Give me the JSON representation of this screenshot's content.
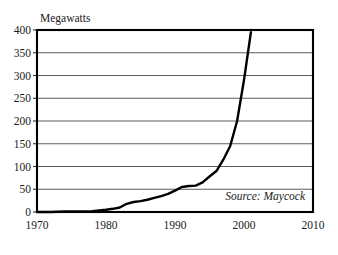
{
  "chart_data": {
    "type": "line",
    "title": "Megawatts",
    "xlabel": "",
    "ylabel": "Megawatts",
    "xlim": [
      1970,
      2010
    ],
    "ylim": [
      0,
      400
    ],
    "ytick_step": 50,
    "xtick_step": 10,
    "grid": "horizontal",
    "legend": "none",
    "annotation": "Source: Maycock",
    "ytick_labels": [
      "0",
      "50",
      "100",
      "150",
      "200",
      "250",
      "300",
      "350",
      "400"
    ],
    "ytick_values": [
      0,
      50,
      100,
      150,
      200,
      250,
      300,
      350,
      400
    ],
    "xtick_labels": [
      "1970",
      "1980",
      "1990",
      "2000",
      "2010"
    ],
    "xtick_values": [
      1970,
      1980,
      1990,
      2000,
      2010
    ],
    "series": [
      {
        "name": "Megawatts",
        "color": "#000000",
        "x": [
          1970,
          1972,
          1974,
          1976,
          1978,
          1980,
          1981,
          1982,
          1983,
          1984,
          1985,
          1986,
          1987,
          1988,
          1989,
          1990,
          1991,
          1992,
          1993,
          1994,
          1995,
          1996,
          1997,
          1998,
          1999,
          2000,
          2001
        ],
        "values": [
          0,
          0,
          1,
          1,
          2,
          5,
          7,
          10,
          18,
          22,
          24,
          27,
          31,
          35,
          40,
          47,
          55,
          57,
          58,
          65,
          78,
          90,
          115,
          145,
          200,
          290,
          395
        ]
      }
    ]
  },
  "chart": {
    "title": "Megawatts",
    "source_note": "Source: Maycock"
  }
}
